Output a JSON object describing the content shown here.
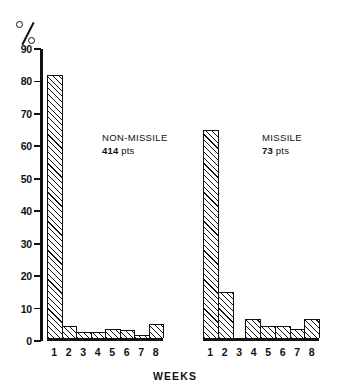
{
  "chart_data": {
    "type": "bar",
    "title": "",
    "subtitle": "",
    "xlabel": "WEEKS",
    "ylabel": "%",
    "ylim": [
      0,
      90
    ],
    "ytick_step": 10,
    "yticks": [
      90,
      80,
      70,
      60,
      50,
      40,
      30,
      20,
      10,
      0
    ],
    "grid": false,
    "legend": "none",
    "categories": [
      "1",
      "2",
      "3",
      "4",
      "5",
      "6",
      "7",
      "8"
    ],
    "panels": [
      {
        "id": "non-missile",
        "name": "NON-MISSILE",
        "count_label": "414 pts",
        "count_value": "414",
        "count_unit": "pts",
        "values": [
          82,
          4,
          2,
          2,
          3,
          2.5,
          1,
          4.5
        ]
      },
      {
        "id": "missile",
        "name": "MISSILE",
        "count_label": "73 pts",
        "count_value": "73",
        "count_unit": "pts",
        "values": [
          65,
          14.5,
          0,
          6,
          4,
          4,
          3,
          6
        ]
      }
    ],
    "series": [
      {
        "name": "NON-MISSILE",
        "values": [
          82,
          4,
          2,
          2,
          3,
          2.5,
          1,
          4.5
        ]
      },
      {
        "name": "MISSILE",
        "values": [
          65,
          14.5,
          0,
          6,
          4,
          4,
          3,
          6
        ]
      }
    ],
    "colors": {
      "ink": "#111111",
      "background": "#ffffff",
      "bar_fill": "#ffffff",
      "bar_hatch": "#111111"
    }
  },
  "axis": {
    "y_unit_symbol": "%",
    "x_title": "WEEKS"
  }
}
